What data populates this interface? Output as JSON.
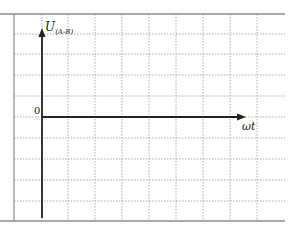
{
  "diagram": {
    "type": "axes-grid",
    "y_axis_label": "U",
    "y_axis_subscript": "(A-B)",
    "x_axis_label": "ωt",
    "origin_label": "0",
    "grid": {
      "columns": 10,
      "rows": 10,
      "line_style": "dotted",
      "line_color": "#9a9a9a"
    },
    "axis_color": "#222222",
    "border_color": "#555555"
  }
}
